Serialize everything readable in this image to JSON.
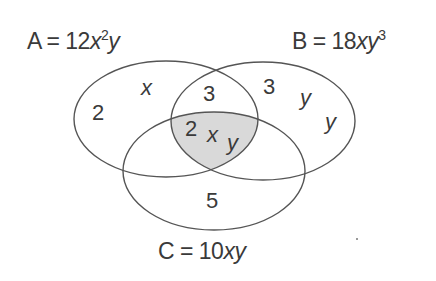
{
  "diagram": {
    "type": "venn",
    "sets": [
      {
        "id": "A",
        "name": "A",
        "expression_prefix": "A = 12",
        "var1": "x",
        "sup1": "2",
        "var2": "y",
        "value": "12x²y"
      },
      {
        "id": "B",
        "name": "B",
        "expression_prefix": "B = 18",
        "var1": "xy",
        "sup1": "3",
        "value": "18xy³"
      },
      {
        "id": "C",
        "name": "C",
        "expression_prefix": "C = 10",
        "var1": "xy",
        "value": "10xy"
      }
    ],
    "regions": {
      "A_only": {
        "factors": [
          "2",
          "x"
        ]
      },
      "A_and_B_only": {
        "factors": [
          "3"
        ]
      },
      "B_only": {
        "factors": [
          "3",
          "y",
          "y"
        ]
      },
      "A_and_B_and_C": {
        "factors": [
          "2",
          "x",
          "y"
        ],
        "shaded": true
      },
      "C_only": {
        "factors": [
          "5"
        ]
      }
    },
    "colors": {
      "outline": "#555555",
      "shade": "#d9d9d9",
      "text": "#3a3a3a",
      "background": "#ffffff"
    }
  }
}
